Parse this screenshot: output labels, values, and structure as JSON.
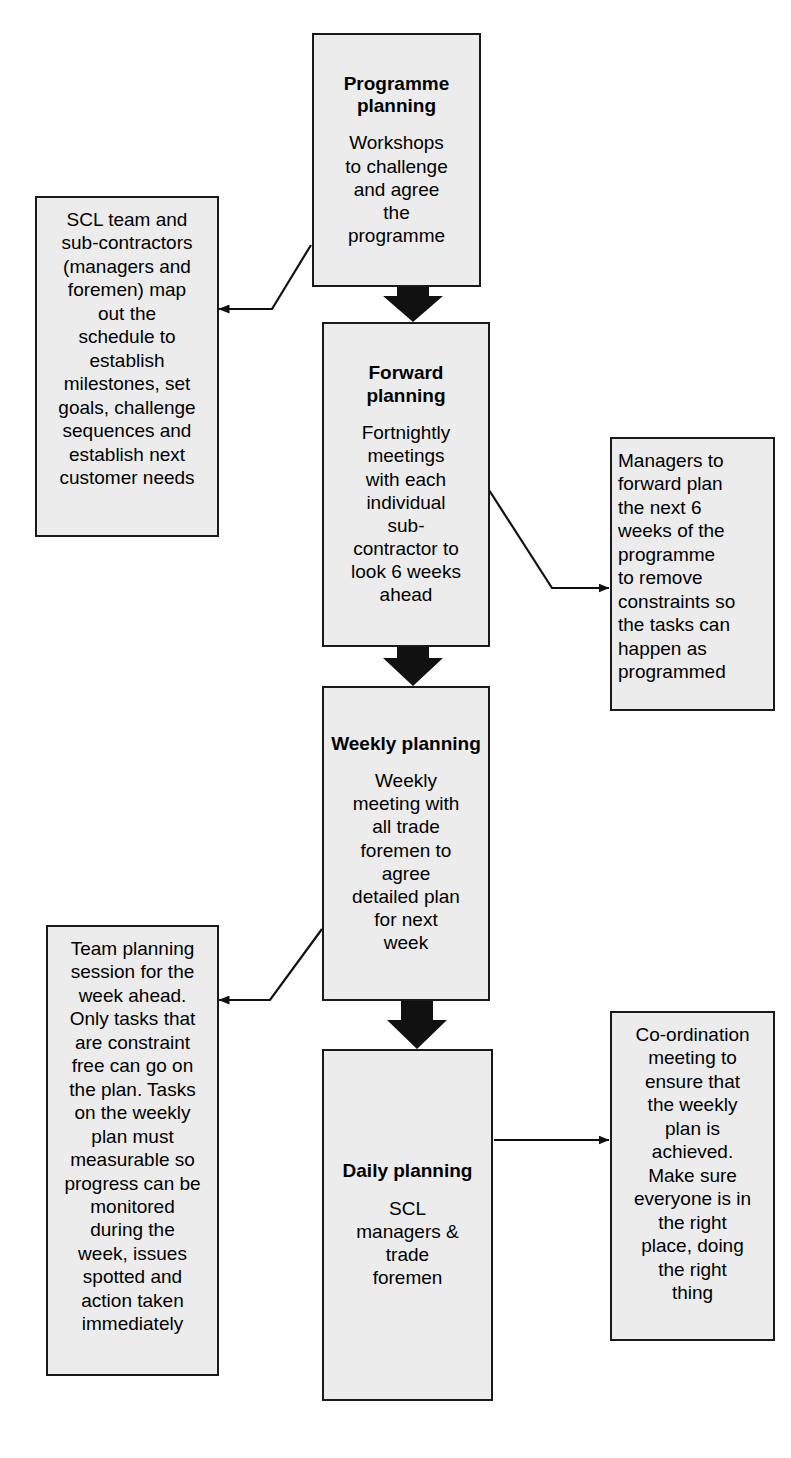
{
  "diagram": {
    "colors": {
      "box_fill": "#ececec",
      "box_border": "#1a1a1a",
      "arrow": "#111111",
      "background": "#ffffff"
    },
    "stages": [
      {
        "id": "programme-planning",
        "title": "Programme\nplanning",
        "body": "Workshops\nto challenge\nand agree\nthe\nprogramme"
      },
      {
        "id": "forward-planning",
        "title": "Forward\nplanning",
        "body": "Fortnightly\nmeetings\nwith each\nindividual\nsub-\ncontractor to\nlook 6 weeks\nahead"
      },
      {
        "id": "weekly-planning",
        "title": "Weekly\nplanning",
        "body": "Weekly\nmeeting with\nall trade\nforemen to\nagree\ndetailed plan\nfor next\nweek"
      },
      {
        "id": "daily-planning",
        "title": "Daily\nplanning",
        "body": "SCL\nmanagers &\ntrade\nforemen"
      }
    ],
    "notes": [
      {
        "id": "scl-team-note",
        "side": "left",
        "align": "center",
        "body": "SCL team and\nsub-contractors\n(managers and\nforemen) map\nout the\nschedule to\nestablish\nmilestones, set\ngoals, challenge\nsequences and\nestablish next\ncustomer needs"
      },
      {
        "id": "managers-forward-plan-note",
        "side": "right",
        "align": "left",
        "body": "Managers to\nforward plan\nthe next 6\nweeks of the\nprogramme\nto remove\nconstraints so\nthe tasks can\nhappen as\nprogrammed"
      },
      {
        "id": "team-planning-session-note",
        "side": "left",
        "align": "center",
        "body": "Team planning\nsession for the\nweek ahead.\nOnly tasks that\nare constraint\nfree can go on\nthe plan. Tasks\non the weekly\nplan must\nmeasurable so\nprogress can be\nmonitored\nduring the\nweek, issues\nspotted and\naction taken\nimmediately"
      },
      {
        "id": "co-ordination-meeting-note",
        "side": "right",
        "align": "center",
        "body": "Co-ordination\nmeeting to\nensure that\nthe weekly\nplan is\nachieved.\nMake sure\neveryone is in\nthe right\nplace, doing\nthe right\nthing"
      }
    ],
    "flow_arrows": [
      {
        "id": "arrow-programme-to-forward",
        "type": "block-arrow-down",
        "from": "programme-planning",
        "to": "forward-planning"
      },
      {
        "id": "arrow-forward-to-weekly",
        "type": "block-arrow-down",
        "from": "forward-planning",
        "to": "weekly-planning"
      },
      {
        "id": "arrow-weekly-to-daily",
        "type": "block-arrow-down",
        "from": "weekly-planning",
        "to": "daily-planning"
      }
    ],
    "connectors": [
      {
        "id": "connector-programme-to-scl-note",
        "type": "elbow-line-arrow",
        "from": "programme-planning",
        "to": "scl-team-note"
      },
      {
        "id": "connector-forward-to-managers-note",
        "type": "elbow-line-arrow",
        "from": "forward-planning",
        "to": "managers-forward-plan-note"
      },
      {
        "id": "connector-weekly-to-team-note",
        "type": "elbow-line-arrow",
        "from": "weekly-planning",
        "to": "team-planning-session-note"
      },
      {
        "id": "connector-daily-to-coordination-note",
        "type": "straight-line-arrow",
        "from": "daily-planning",
        "to": "co-ordination-meeting-note"
      }
    ],
    "footer_partial_text": ""
  }
}
